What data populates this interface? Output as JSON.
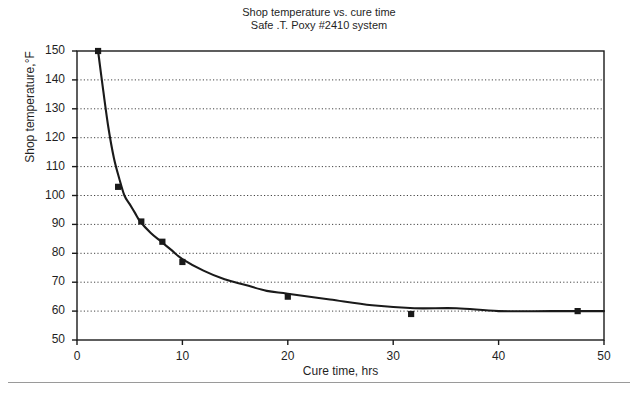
{
  "chart_data": {
    "type": "line",
    "title": "Shop temperature vs. cure time",
    "subtitle": "Safe .T. Poxy #2410 system",
    "xlabel": "Cure time, hrs",
    "ylabel": "Shop temperature,°F",
    "xlim": [
      0,
      50
    ],
    "ylim": [
      50,
      150
    ],
    "xticks": [
      0,
      10,
      20,
      30,
      40,
      50
    ],
    "yticks": [
      50,
      60,
      70,
      80,
      90,
      100,
      110,
      120,
      130,
      140,
      150
    ],
    "xtick_labels": [
      "0",
      "10",
      "20",
      "30",
      "40",
      "50"
    ],
    "ytick_labels": [
      "50",
      "60",
      "70",
      "80",
      "90",
      "100",
      "110",
      "120",
      "130",
      "140",
      "150"
    ],
    "grid": "horizontal-dotted",
    "legend": "none",
    "series": [
      {
        "name": "Cure curve",
        "marker": "filled-square",
        "line": "solid",
        "color": "#1a1a1a",
        "points": [
          {
            "x": 2.0,
            "y": 150
          },
          {
            "x": 3.9,
            "y": 103
          },
          {
            "x": 6.1,
            "y": 91
          },
          {
            "x": 8.1,
            "y": 84
          },
          {
            "x": 10.0,
            "y": 77
          },
          {
            "x": 20.0,
            "y": 65
          },
          {
            "x": 31.7,
            "y": 59
          },
          {
            "x": 47.5,
            "y": 60
          }
        ],
        "fit_curve": [
          {
            "x": 2.0,
            "y": 150
          },
          {
            "x": 2.5,
            "y": 136
          },
          {
            "x": 3.0,
            "y": 123
          },
          {
            "x": 3.5,
            "y": 113
          },
          {
            "x": 4.0,
            "y": 106
          },
          {
            "x": 4.5,
            "y": 100
          },
          {
            "x": 5.0,
            "y": 97
          },
          {
            "x": 5.5,
            "y": 94
          },
          {
            "x": 6.0,
            "y": 91
          },
          {
            "x": 7.0,
            "y": 87
          },
          {
            "x": 8.0,
            "y": 84
          },
          {
            "x": 9.0,
            "y": 81
          },
          {
            "x": 10.0,
            "y": 78
          },
          {
            "x": 12.0,
            "y": 74
          },
          {
            "x": 14.0,
            "y": 71
          },
          {
            "x": 16.0,
            "y": 69
          },
          {
            "x": 18.0,
            "y": 67
          },
          {
            "x": 20.0,
            "y": 66
          },
          {
            "x": 24.0,
            "y": 64
          },
          {
            "x": 28.0,
            "y": 62
          },
          {
            "x": 32.0,
            "y": 61
          },
          {
            "x": 36.0,
            "y": 61
          },
          {
            "x": 40.0,
            "y": 60
          },
          {
            "x": 45.0,
            "y": 60
          },
          {
            "x": 50.0,
            "y": 60
          }
        ]
      }
    ]
  }
}
